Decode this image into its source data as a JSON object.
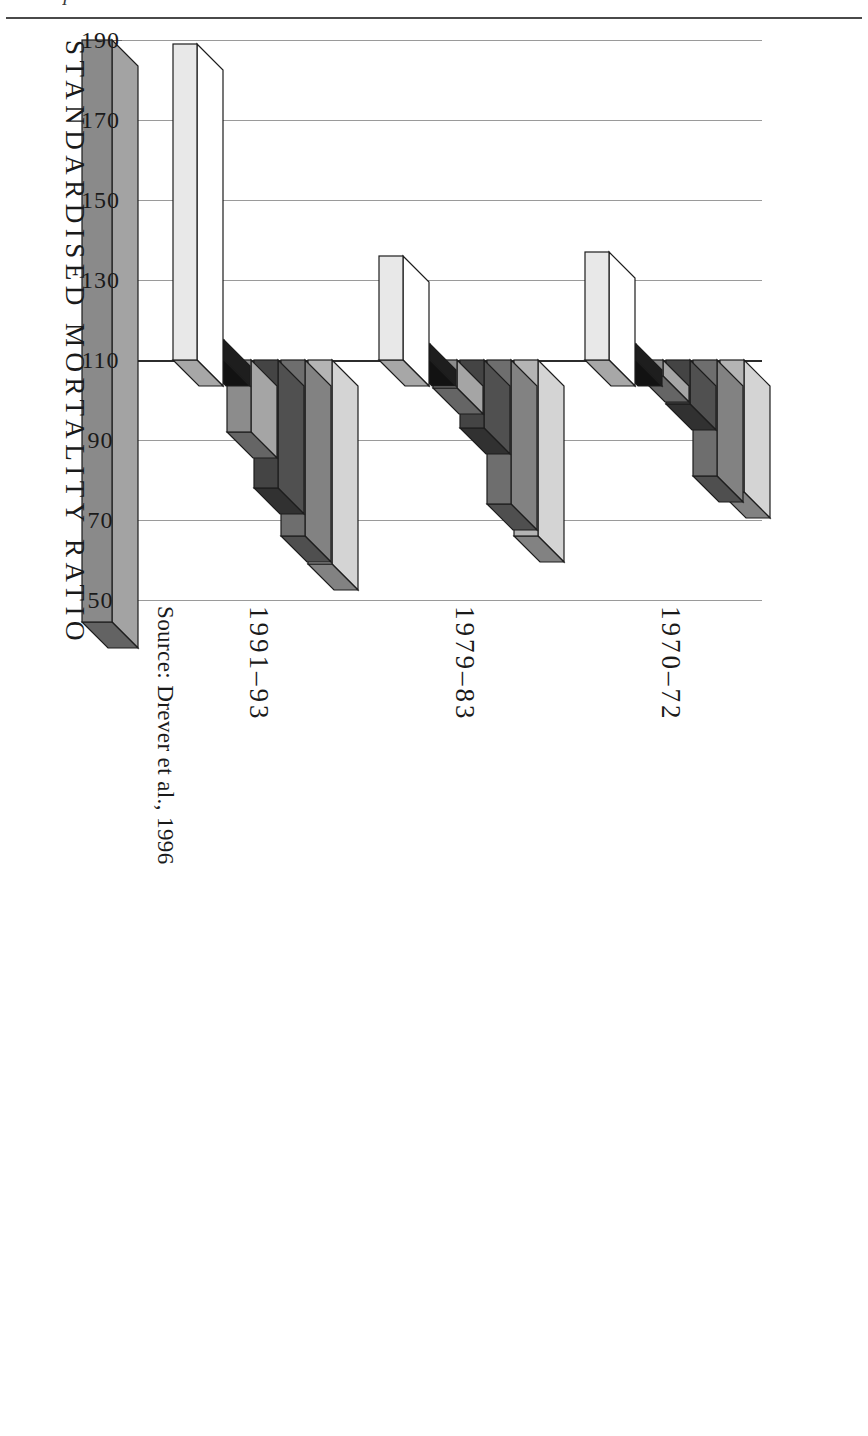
{
  "page": {
    "running_head": "I",
    "source_note": "Source: Drever et al., 1996"
  },
  "figure": {
    "axis_title": "STANDARDISED MORTALITY RATIO",
    "legend_title": "",
    "legend": [
      {
        "label": "I",
        "color": "#b4b4b4"
      },
      {
        "label": "II",
        "color": "#6e6e6e"
      },
      {
        "label": "IIINM",
        "color": "#444444"
      },
      {
        "label": "IIIM",
        "color": "#8c8c8c"
      },
      {
        "label": "IV",
        "color": "#191919"
      },
      {
        "label": "V",
        "color": "#e8e8e8"
      }
    ],
    "group_labels": [
      "1970–72",
      "1979–83",
      "1991–93"
    ],
    "tick_labels": [
      "190",
      "170",
      "150",
      "130",
      "110",
      "90",
      "70",
      "50"
    ]
  },
  "chart_data": {
    "type": "bar",
    "title": "",
    "subtitle": "",
    "xlabel": "",
    "ylabel": "STANDARDISED MORTALITY RATIO",
    "ylim": [
      50,
      190
    ],
    "yticks": [
      190,
      170,
      150,
      130,
      110,
      90,
      70,
      50
    ],
    "grid": true,
    "legend_position": "left",
    "orientation": "horizontal-3d",
    "categories": [
      "1970–72",
      "1979–83",
      "1991–93"
    ],
    "series": [
      {
        "name": "I",
        "color": "#b4b4b4",
        "values": [
          77,
          66,
          59
        ]
      },
      {
        "name": "II",
        "color": "#6e6e6e",
        "values": [
          81,
          74,
          66
        ]
      },
      {
        "name": "IIINM",
        "color": "#444444",
        "values": [
          99,
          93,
          78
        ]
      },
      {
        "name": "IIIM",
        "color": "#8c8c8c",
        "values": [
          106,
          103,
          92
        ]
      },
      {
        "name": "IV",
        "color": "#191919",
        "values": [
          114,
          114,
          115
        ]
      },
      {
        "name": "V",
        "color": "#e8e8e8",
        "values": [
          137,
          136,
          189
        ]
      }
    ]
  }
}
